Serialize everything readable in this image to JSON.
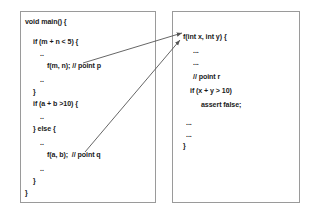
{
  "diagram": {
    "stroke_color": "#555555",
    "box_border_color": "#9a9a9a",
    "text_color": "#1a1a1a",
    "background": "#ffffff"
  },
  "caller_box": {
    "name": "main-function-box",
    "lines": [
      {
        "text": "void main() {",
        "indent": 0,
        "x": 25,
        "y": 18
      },
      {
        "text": "if (m + n < 5) {",
        "indent": 1,
        "x": 33,
        "y": 38
      },
      {
        "text": "..",
        "indent": 2,
        "x": 40,
        "y": 50
      },
      {
        "text": "f(m, n); // point p",
        "indent": 3,
        "x": 47,
        "y": 62
      },
      {
        "text": "..",
        "indent": 2,
        "x": 40,
        "y": 76
      },
      {
        "text": "}",
        "indent": 1,
        "x": 33,
        "y": 88
      },
      {
        "text": "if (a + b >10) {",
        "indent": 1,
        "x": 33,
        "y": 100
      },
      {
        "text": "..",
        "indent": 2,
        "x": 40,
        "y": 113
      },
      {
        "text": "} else {",
        "indent": 1,
        "x": 33,
        "y": 125
      },
      {
        "text": "..",
        "indent": 2,
        "x": 40,
        "y": 139
      },
      {
        "text": "f(a, b);  // point q",
        "indent": 3,
        "x": 47,
        "y": 151
      },
      {
        "text": "..",
        "indent": 2,
        "x": 40,
        "y": 165
      },
      {
        "text": "}",
        "indent": 1,
        "x": 33,
        "y": 177
      },
      {
        "text": "}",
        "indent": 0,
        "x": 25,
        "y": 189
      }
    ]
  },
  "callee_box": {
    "name": "f-function-box",
    "lines": [
      {
        "text": "f(int x, int y) {",
        "indent": 0,
        "x": 183,
        "y": 33
      },
      {
        "text": "...",
        "indent": 1,
        "x": 193,
        "y": 47
      },
      {
        "text": "...",
        "indent": 1,
        "x": 193,
        "y": 59
      },
      {
        "text": "// point r",
        "indent": 1,
        "x": 193,
        "y": 73
      },
      {
        "text": "if (x + y > 10)",
        "indent": 1,
        "x": 190,
        "y": 87
      },
      {
        "text": "assert false;",
        "indent": 2,
        "x": 201,
        "y": 101
      },
      {
        "text": "...",
        "indent": 1,
        "x": 186,
        "y": 119
      },
      {
        "text": "...",
        "indent": 1,
        "x": 186,
        "y": 131
      },
      {
        "text": "}",
        "indent": 0,
        "x": 183,
        "y": 142
      }
    ]
  },
  "arrows": [
    {
      "name": "arrow-point-p-to-f",
      "from_label": "point p",
      "to_label": "f(int x, int y)",
      "x1": 83,
      "y1": 63,
      "x2": 182,
      "y2": 33
    },
    {
      "name": "arrow-point-q-to-f",
      "from_label": "point q",
      "to_label": "f(int x, int y)",
      "x1": 85,
      "y1": 152,
      "x2": 180,
      "y2": 40
    }
  ]
}
